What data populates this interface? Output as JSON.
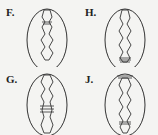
{
  "diagram": {
    "options": [
      {
        "label": "F.",
        "id": "F",
        "constrictions": [
          {
            "y": 0.22,
            "type": "double-band"
          }
        ]
      },
      {
        "label": "H.",
        "id": "H",
        "constrictions": [
          {
            "y": 0.9,
            "type": "triple-band"
          }
        ]
      },
      {
        "label": "G.",
        "id": "G",
        "constrictions": [
          {
            "y": 0.62,
            "type": "triple-band"
          }
        ]
      },
      {
        "label": "J.",
        "id": "J",
        "constrictions": [
          {
            "y": 0.9,
            "type": "double-band"
          },
          {
            "y": 0.1,
            "type": "cap-band"
          }
        ]
      }
    ],
    "colors": {
      "line": "#333333",
      "background": "#f4f4f2"
    }
  }
}
